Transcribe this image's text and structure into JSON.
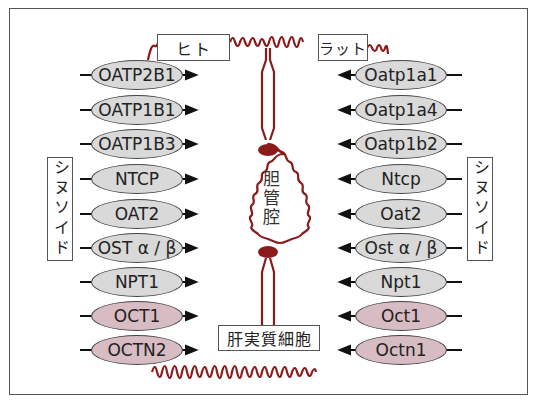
{
  "colors": {
    "membrane": "#8b1a1a",
    "transporter_gray": "#d9d9d9",
    "transporter_pink": "#d8bcc3",
    "outline": "#444444",
    "arrow": "#111111"
  },
  "labels": {
    "human": "ヒト",
    "rat": "ラット",
    "sinusoid_left": "シヌソイド",
    "sinusoid_right": "シヌソイド",
    "bile_canaliculus": "胆管腔",
    "hepatocyte": "肝実質細胞"
  },
  "human_transporters": [
    {
      "name": "OATP2B1",
      "color": "gray",
      "direction": "in"
    },
    {
      "name": "OATP1B1",
      "color": "gray",
      "direction": "in"
    },
    {
      "name": "OATP1B3",
      "color": "gray",
      "direction": "in"
    },
    {
      "name": "NTCP",
      "color": "gray",
      "direction": "in"
    },
    {
      "name": "OAT2",
      "color": "gray",
      "direction": "in"
    },
    {
      "name": "OST α / β",
      "color": "gray",
      "direction": "in"
    },
    {
      "name": "NPT1",
      "color": "gray",
      "direction": "in"
    },
    {
      "name": "OCT1",
      "color": "pink",
      "direction": "in"
    },
    {
      "name": "OCTN2",
      "color": "pink",
      "direction": "in"
    }
  ],
  "rat_transporters": [
    {
      "name": "Oatp1a1",
      "color": "gray",
      "direction": "in"
    },
    {
      "name": "Oatp1a4",
      "color": "gray",
      "direction": "in"
    },
    {
      "name": "Oatp1b2",
      "color": "gray",
      "direction": "in"
    },
    {
      "name": "Ntcp",
      "color": "gray",
      "direction": "in"
    },
    {
      "name": "Oat2",
      "color": "gray",
      "direction": "in"
    },
    {
      "name": "Ost α / β",
      "color": "gray",
      "direction": "in"
    },
    {
      "name": "Npt1",
      "color": "gray",
      "direction": "in"
    },
    {
      "name": "Oct1",
      "color": "pink",
      "direction": "in"
    },
    {
      "name": "Octn1",
      "color": "pink",
      "direction": "in"
    }
  ]
}
